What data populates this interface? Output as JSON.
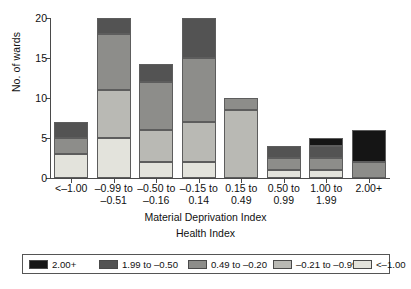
{
  "chart_data": {
    "type": "bar",
    "subtype": "stacked",
    "title": "",
    "xlabel": "Material Deprivation Index",
    "xlabel_secondary": "Health Index",
    "ylabel": "No. of wards",
    "ylim": [
      0,
      20
    ],
    "yticks": [
      0,
      5,
      10,
      15,
      20
    ],
    "grid": false,
    "legend_position": "bottom",
    "legend_title": "Health Index",
    "categories": [
      "<–1.00",
      "–0.99 to\n–0.51",
      "–0.50 to\n–0.16",
      "–0.15 to\n0.14",
      "0.15 to\n0.49",
      "0.50 to\n0.99",
      "1.00 to\n1.99",
      "2.00+"
    ],
    "series": [
      {
        "name": "<–1.00",
        "color": "#e3e3dc",
        "values": [
          3,
          5,
          2,
          2,
          0,
          1,
          1,
          0
        ]
      },
      {
        "name": "–0.21 to –0.99",
        "color": "#b9b9b4",
        "values": [
          0,
          6,
          4,
          5,
          8.5,
          0,
          0,
          0
        ]
      },
      {
        "name": "0.49 to –0.20",
        "color": "#8d8d8a",
        "values": [
          2,
          7,
          6,
          8,
          1.5,
          1.5,
          1.5,
          2
        ]
      },
      {
        "name": "1.99 to –0.50",
        "color": "#535353",
        "values": [
          2,
          2,
          2.3,
          5,
          0,
          1.5,
          1.5,
          0
        ]
      },
      {
        "name": "2.00+",
        "color": "#151515",
        "values": [
          0,
          0,
          0,
          0,
          0,
          0,
          1,
          4
        ]
      }
    ],
    "bar_totals": [
      7,
      20,
      14.3,
      20,
      10,
      4,
      5,
      6
    ]
  },
  "legend": {
    "entries": [
      {
        "label": "2.00+",
        "color": "#151515"
      },
      {
        "label": "1.99 to –0.50",
        "color": "#535353"
      },
      {
        "label": "0.49 to –0.20",
        "color": "#8d8d8a"
      },
      {
        "label": "–0.21 to –0.99",
        "color": "#b9b9b4"
      },
      {
        "label": "<–1.00",
        "color": "#e3e3dc"
      }
    ]
  },
  "axes": {
    "y_title": "No. of wards",
    "x_title": "Material Deprivation Index",
    "x_subtitle": "Health Index",
    "y_tick_labels": [
      "0",
      "5",
      "10",
      "15",
      "20"
    ]
  }
}
